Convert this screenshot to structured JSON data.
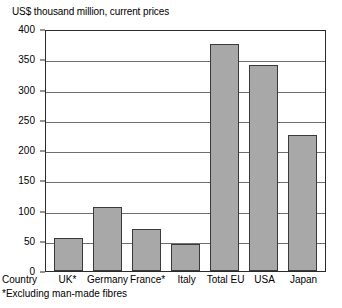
{
  "chart_data": {
    "type": "bar",
    "title": "US$ thousand million, current prices",
    "xlabel": "Country",
    "ylabel": "",
    "ylim": [
      0,
      400
    ],
    "yticks": [
      0,
      50,
      100,
      150,
      200,
      250,
      300,
      350,
      400
    ],
    "grid": true,
    "legend": "none",
    "categories": [
      "UK*",
      "Germany",
      "France*",
      "Italy",
      "Total EU",
      "USA",
      "Japan"
    ],
    "values": [
      55,
      105,
      70,
      45,
      375,
      340,
      225
    ],
    "annotations": [
      "*Excluding man-made fibres"
    ],
    "bar_color": "#a8a8a8",
    "bar_border_color": "#3a3a3a",
    "gridline_color": "#6f6f6f",
    "axis_color": "#2b2b2b"
  }
}
